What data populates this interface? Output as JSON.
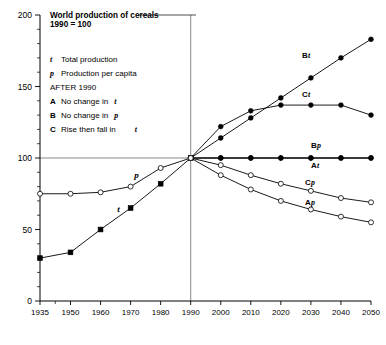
{
  "chart_data": {
    "type": "line",
    "title": "World production of cereals",
    "subtitle": "1990 = 100",
    "xlabel": "",
    "ylabel": "",
    "xlim": [
      1935,
      2050
    ],
    "ylim": [
      0,
      200
    ],
    "grid": false,
    "legend_position": "top-left-inside",
    "x_ticks": [
      "1935",
      "1950",
      "1960",
      "1970",
      "1980",
      "1990",
      "2000",
      "2010",
      "2020",
      "2030",
      "2040",
      "2050"
    ],
    "x_tick_values": [
      1935,
      1950,
      1960,
      1970,
      1980,
      1990,
      2000,
      2010,
      2020,
      2030,
      2040,
      2050
    ],
    "y_ticks": [
      "0",
      "50",
      "100",
      "150",
      "200"
    ],
    "y_tick_values": [
      0,
      50,
      100,
      150,
      200
    ],
    "y_minor_step": 10,
    "reference_lines": [
      {
        "name": "year-1990-vertical",
        "orientation": "vertical",
        "value": 1990
      },
      {
        "name": "index-100-horizontal",
        "orientation": "horizontal",
        "value": 100
      }
    ],
    "legend_entries": [
      {
        "symbol": "t",
        "style": "italic",
        "label": "Total production"
      },
      {
        "symbol": "p",
        "style": "italic",
        "label": "Production per capita"
      },
      {
        "symbol": "",
        "style": "plain",
        "label": "AFTER 1990"
      },
      {
        "symbol": "A",
        "style": "bold",
        "label": "No change in t",
        "label_italic_tail": "t"
      },
      {
        "symbol": "B",
        "style": "bold",
        "label": "No change in p",
        "label_italic_tail": "p"
      },
      {
        "symbol": "C",
        "style": "bold",
        "label": "Rise then fall in t",
        "label_italic_tail": "t"
      }
    ],
    "series": [
      {
        "name": "t",
        "display_label": "t",
        "description": "Total production, historical 1935-1990",
        "marker": "filled-square",
        "x": [
          1935,
          1950,
          1960,
          1970,
          1980,
          1990
        ],
        "values": [
          30,
          34,
          50,
          65,
          82,
          100
        ]
      },
      {
        "name": "p",
        "display_label": "p",
        "description": "Production per capita, historical 1935-1990",
        "marker": "open-circle",
        "x": [
          1935,
          1950,
          1960,
          1970,
          1980,
          1990
        ],
        "values": [
          75,
          75,
          76,
          80,
          93,
          100
        ]
      },
      {
        "name": "Bt",
        "display_label": "Bt",
        "description": "Scenario B total production, 1990-2050",
        "marker": "filled-circle",
        "x": [
          1990,
          2000,
          2010,
          2020,
          2030,
          2040,
          2050
        ],
        "values": [
          100,
          114,
          128,
          142,
          156,
          170,
          183
        ]
      },
      {
        "name": "Ct",
        "display_label": "Ct",
        "description": "Scenario C total production, 1990-2050",
        "marker": "filled-circle",
        "x": [
          1990,
          2000,
          2010,
          2020,
          2030,
          2040,
          2050
        ],
        "values": [
          100,
          122,
          133,
          137,
          137,
          137,
          130
        ]
      },
      {
        "name": "Bp",
        "display_label": "Bp",
        "description": "Scenario B production per capita, 1990-2050",
        "marker": "filled-circle",
        "x": [
          1990,
          2000,
          2010,
          2020,
          2030,
          2040,
          2050
        ],
        "values": [
          100,
          100,
          100,
          100,
          100,
          100,
          100
        ]
      },
      {
        "name": "At",
        "display_label": "At",
        "description": "Scenario A total production, 1990-2050",
        "marker": "filled-circle",
        "x": [
          1990,
          2000,
          2010,
          2020,
          2030,
          2040,
          2050
        ],
        "values": [
          100,
          100,
          100,
          100,
          100,
          100,
          100
        ]
      },
      {
        "name": "Cp",
        "display_label": "Cp",
        "description": "Scenario C production per capita, 1990-2050",
        "marker": "open-circle",
        "x": [
          1990,
          2000,
          2010,
          2020,
          2030,
          2040,
          2050
        ],
        "values": [
          100,
          95,
          88,
          82,
          77,
          72,
          69
        ]
      },
      {
        "name": "Ap",
        "display_label": "Ap",
        "description": "Scenario A production per capita, 1990-2050",
        "marker": "open-circle",
        "x": [
          1990,
          2000,
          2010,
          2020,
          2030,
          2040,
          2050
        ],
        "values": [
          100,
          88,
          78,
          70,
          64,
          59,
          55
        ]
      }
    ],
    "annotations": [
      {
        "name": "inline-label-t",
        "text": "t",
        "x": 1966,
        "y": 62
      },
      {
        "name": "inline-label-p",
        "text": "p",
        "x": 1972,
        "y": 86
      },
      {
        "name": "curve-label-Bt",
        "text_bold": "B",
        "text_italic": "t",
        "x": 2027,
        "y": 170
      },
      {
        "name": "curve-label-Ct",
        "text_bold": "C",
        "text_italic": "t",
        "x": 2027,
        "y": 143
      },
      {
        "name": "curve-label-Bp",
        "text_bold": "B",
        "text_italic": "p",
        "x": 2030,
        "y": 107
      },
      {
        "name": "curve-label-At",
        "text_bold": "A",
        "text_italic": "t",
        "x": 2030,
        "y": 93
      },
      {
        "name": "curve-label-Cp",
        "text_bold": "C",
        "text_italic": "p",
        "x": 2028,
        "y": 81
      },
      {
        "name": "curve-label-Ap",
        "text_bold": "A",
        "text_italic": "p",
        "x": 2028,
        "y": 67
      }
    ],
    "colors": {
      "line": "#000000",
      "background": "#ffffff",
      "axis": "#000000",
      "reference": "#555555"
    }
  }
}
